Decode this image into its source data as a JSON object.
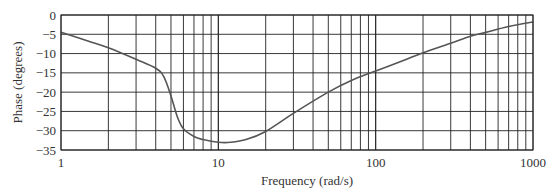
{
  "chart_data": {
    "type": "line",
    "title": "",
    "xlabel": "Frequency (rad/s)",
    "ylabel": "Phase (degrees)",
    "xscale": "log",
    "xlim": [
      1,
      1000
    ],
    "ylim": [
      -35,
      0
    ],
    "grid": true,
    "legend": null,
    "x_tick_labels": [
      "1",
      "10",
      "100",
      "1000"
    ],
    "x_ticks": [
      1,
      10,
      100,
      1000
    ],
    "y_tick_labels": [
      "0",
      "-5",
      "-10",
      "-15",
      "-20",
      "-25",
      "-30",
      "-35"
    ],
    "y_ticks": [
      0,
      -5,
      -10,
      -15,
      -20,
      -25,
      -30,
      -35
    ],
    "series": [
      {
        "name": "Phase",
        "color": "#555555",
        "x": [
          1,
          1.5,
          2,
          3,
          4,
          4.5,
          5,
          5.5,
          6,
          7,
          8,
          10,
          12,
          15,
          20,
          30,
          50,
          70,
          100,
          150,
          200,
          300,
          400,
          500,
          700,
          1000
        ],
        "values": [
          -4.5,
          -6.8,
          -8.5,
          -11.5,
          -13.8,
          -16,
          -21,
          -26.5,
          -29.5,
          -31.5,
          -32.3,
          -33,
          -33,
          -32.3,
          -30.2,
          -25.5,
          -20,
          -17,
          -14.5,
          -11.8,
          -9.8,
          -7.3,
          -5.5,
          -4.5,
          -3,
          -1.8
        ]
      }
    ]
  },
  "plot": {
    "left": 61,
    "right": 533,
    "top": 15,
    "bottom": 150,
    "grid_color": "#222222",
    "curve_color": "#555555"
  }
}
